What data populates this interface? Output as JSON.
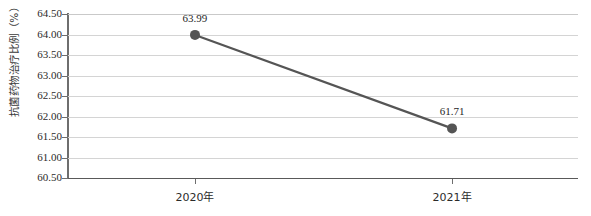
{
  "chart_data": {
    "type": "line",
    "title": "",
    "xlabel": "",
    "ylabel": "抗菌药物治疗比例（%）",
    "categories": [
      "2020年",
      "2021年"
    ],
    "values": [
      63.99,
      61.71
    ],
    "data_labels": [
      "63.99",
      "61.71"
    ],
    "series": [
      {
        "name": "抗菌药物治疗比例",
        "values": [
          63.99,
          61.71
        ]
      }
    ],
    "ylim": [
      60.5,
      64.5
    ],
    "ytick_step": 0.5,
    "ytick_labels": [
      "64.50",
      "64.00",
      "63.50",
      "63.00",
      "62.50",
      "62.00",
      "61.50",
      "61.00",
      "60.50"
    ],
    "ytick_values": [
      64.5,
      64.0,
      63.5,
      63.0,
      62.5,
      62.0,
      61.5,
      61.0,
      60.5
    ],
    "grid": true,
    "legend": "none",
    "colors": {
      "line": "#555555",
      "marker": "#555555",
      "gridline": "#d4d4d4",
      "axis": "#6e6e6e",
      "text": "#2b2b2b",
      "background": "#ffffff"
    }
  }
}
